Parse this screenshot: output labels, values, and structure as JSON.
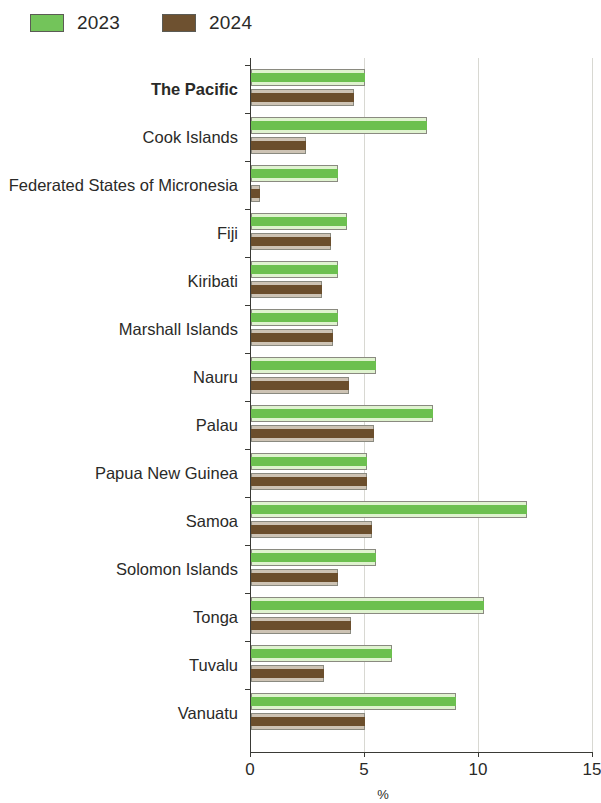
{
  "chart_data": {
    "type": "bar",
    "orientation": "horizontal",
    "title": "",
    "subtitle": "",
    "xlabel": "%",
    "ylabel": "",
    "xlim": [
      0,
      15
    ],
    "xticks": [
      0,
      5,
      10,
      15
    ],
    "xtick_labels": [
      "0",
      "5",
      "10",
      "15"
    ],
    "grid": true,
    "grid_axis": "x",
    "legend_position": "top-left",
    "categories": [
      "The Pacific",
      "Cook Islands",
      "Federated States of Micronesia",
      "Fiji",
      "Kiribati",
      "Marshall Islands",
      "Nauru",
      "Palau",
      "Papua New Guinea",
      "Samoa",
      "Solomon Islands",
      "Tonga",
      "Tuvalu",
      "Vanuatu"
    ],
    "series": [
      {
        "name": "2023",
        "color": "#6cc04f",
        "values": [
          5.0,
          7.7,
          3.8,
          4.2,
          3.8,
          3.8,
          5.5,
          8.0,
          5.1,
          12.1,
          5.5,
          10.2,
          6.2,
          9.0
        ]
      },
      {
        "name": "2024",
        "color": "#6b4e2c",
        "values": [
          4.5,
          2.4,
          0.4,
          3.5,
          3.1,
          3.6,
          4.3,
          5.4,
          5.1,
          5.3,
          3.8,
          4.4,
          3.2,
          5.0
        ]
      }
    ]
  },
  "legend": {
    "items": [
      {
        "label": "2023",
        "color": "#73c45a",
        "swatch": "green"
      },
      {
        "label": "2024",
        "color": "#6e5130",
        "swatch": "brown"
      }
    ]
  },
  "axis": {
    "x_title": "%",
    "tick_labels": [
      "0",
      "5",
      "10",
      "15"
    ]
  },
  "emphasis": {
    "bold_category": "The Pacific"
  }
}
